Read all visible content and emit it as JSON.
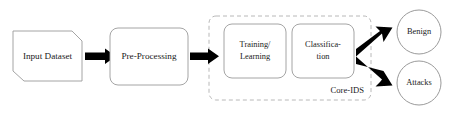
{
  "diagram": {
    "background_color": "#ffffff",
    "stroke_color": "#9a9a9a",
    "arrow_color": "#000000",
    "group_stroke_color": "#b0b0b0",
    "text_color": "#1a1a1a"
  },
  "nodes": {
    "input_dataset": {
      "label": "Input Dataset",
      "shape": "clipped-corner-rect"
    },
    "pre_processing": {
      "label": "Pre-Processing",
      "shape": "rounded-rect"
    },
    "training_learning": {
      "label_line1": "Training/",
      "label_line2": "Learning",
      "shape": "rounded-rect"
    },
    "classification": {
      "label_line1": "Classifica-",
      "label_line2": "tion",
      "shape": "rounded-rect"
    },
    "benign": {
      "label": "Benign",
      "shape": "circle"
    },
    "attacks": {
      "label": "Attacks",
      "shape": "circle"
    }
  },
  "group": {
    "core_ids": {
      "label": "Core-IDS",
      "shape": "dashed-rounded-rect"
    }
  },
  "connectors": [
    {
      "name": "input-to-preprocessing",
      "type": "arrow",
      "direction": "right"
    },
    {
      "name": "preprocessing-to-coreids",
      "type": "arrow",
      "direction": "right"
    },
    {
      "name": "classification-to-benign",
      "type": "arrow",
      "direction": "up-right"
    },
    {
      "name": "classification-to-attacks",
      "type": "arrow",
      "direction": "down-right"
    }
  ]
}
